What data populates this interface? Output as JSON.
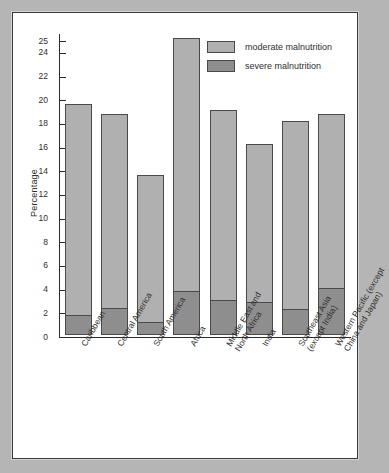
{
  "chart_data": {
    "type": "bar",
    "subtype": "stacked",
    "title": "",
    "xlabel": "",
    "ylabel": "Percentage",
    "ylim": [
      0,
      25.6
    ],
    "yticks": [
      0,
      2,
      4,
      6,
      8,
      10,
      12,
      14,
      16,
      18,
      20,
      22,
      24,
      25
    ],
    "ytick_labels": [
      "0",
      "2",
      "4",
      "6",
      "8",
      "10",
      "12",
      "14",
      "16",
      "18",
      "20",
      "22",
      "24",
      "25"
    ],
    "grid": false,
    "legend_position": "top-right",
    "categories": [
      "Caribbean",
      "Central America",
      "South America",
      "Africa",
      "Middle East and North Africa",
      "India",
      "Southeast Asia (except India)",
      "Western Pacific (except China and Japan)"
    ],
    "category_lines": [
      [
        "Caribbean"
      ],
      [
        "Central America"
      ],
      [
        "South America"
      ],
      [
        "Africa"
      ],
      [
        "Middle East and",
        "North Africa"
      ],
      [
        "India"
      ],
      [
        "Southeast Asia",
        "(except India)"
      ],
      [
        "Western Pacific (except",
        "China and Japan)"
      ]
    ],
    "series": [
      {
        "name": "severe malnutrition",
        "color": "#8e8e8e",
        "values": [
          1.7,
          2.3,
          1.1,
          3.7,
          3.0,
          2.8,
          2.2,
          4.0
        ]
      },
      {
        "name": "moderate malnutrition",
        "color": "#b0b0b0",
        "values": [
          17.8,
          16.4,
          12.4,
          21.4,
          16.0,
          13.3,
          15.9,
          14.7
        ]
      }
    ],
    "totals": [
      19.5,
      18.7,
      13.5,
      25.1,
      19.0,
      16.1,
      18.1,
      18.7
    ]
  },
  "legend": {
    "items": [
      {
        "label": "moderate malnutrition",
        "swatch": "moderate"
      },
      {
        "label": "severe malnutrition",
        "swatch": "severe"
      }
    ]
  },
  "colors": {
    "page_background": "#b5b5b5",
    "panel_background": "#ffffff",
    "panel_border": "#3a3a3a",
    "axis": "#2b2b2b",
    "moderate": "#b0b0b0",
    "severe": "#8e8e8e",
    "bar_outline": "#4a4a4a",
    "text": "#2e2e2e"
  }
}
